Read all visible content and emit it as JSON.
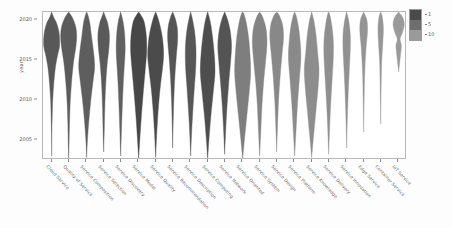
{
  "chart_data": {
    "type": "violin",
    "title": "",
    "xlabel": "",
    "ylabel": "year",
    "ylim": [
      2002.5,
      2021.0
    ],
    "yticks": [
      2005,
      2010,
      2015,
      2020
    ],
    "ytick_labels": [
      "2005",
      "2010",
      "2015",
      "2020"
    ],
    "grid": false,
    "legend": {
      "position": "top-right",
      "title": "",
      "entries": [
        {
          "label": "1",
          "color": "#4a4a4a"
        },
        {
          "label": "5",
          "color": "#6e6e6e"
        },
        {
          "label": "10",
          "color": "#9a9a9a"
        }
      ]
    },
    "categories": [
      "Cloud Service",
      "Quality of Service",
      "Service Composition",
      "Service Selection",
      "Service Discovery",
      "Service Model",
      "Service Quality",
      "Service Recommendation",
      "Service Description",
      "Service Computing",
      "Service Network",
      "Service Oriented",
      "Service System",
      "Service Design",
      "Service Platform",
      "Service Knowledge",
      "Service Delivery",
      "Service Innovation",
      "Edge Service",
      "Container Service",
      "IoT Service"
    ],
    "series": [
      {
        "name": "Cloud Service",
        "color": "#585858",
        "peak_year": 2017.2,
        "median": 2016.0,
        "widths": [
          {
            "year": 2003.0,
            "w": 0.0
          },
          {
            "year": 2005.5,
            "w": 0.02
          },
          {
            "year": 2008.0,
            "w": 0.07
          },
          {
            "year": 2010.0,
            "w": 0.13
          },
          {
            "year": 2012.0,
            "w": 0.26
          },
          {
            "year": 2014.0,
            "w": 0.46
          },
          {
            "year": 2015.5,
            "w": 0.72
          },
          {
            "year": 2016.8,
            "w": 1.0
          },
          {
            "year": 2018.4,
            "w": 0.93
          },
          {
            "year": 2019.6,
            "w": 0.62
          },
          {
            "year": 2020.4,
            "w": 0.22
          },
          {
            "year": 2021.0,
            "w": 0.0
          }
        ]
      },
      {
        "name": "Quality of Service",
        "color": "#5c5c5c",
        "peak_year": 2017.5,
        "median": 2015.5,
        "widths": [
          {
            "year": 2002.6,
            "w": 0.0
          },
          {
            "year": 2004.5,
            "w": 0.05
          },
          {
            "year": 2007.0,
            "w": 0.1
          },
          {
            "year": 2009.5,
            "w": 0.18
          },
          {
            "year": 2012.0,
            "w": 0.34
          },
          {
            "year": 2014.5,
            "w": 0.58
          },
          {
            "year": 2016.5,
            "w": 0.88
          },
          {
            "year": 2017.8,
            "w": 1.0
          },
          {
            "year": 2019.0,
            "w": 0.92
          },
          {
            "year": 2020.2,
            "w": 0.52
          },
          {
            "year": 2021.0,
            "w": 0.0
          }
        ]
      },
      {
        "name": "Service Composition",
        "color": "#5e5e5e",
        "peak_year": 2014.0,
        "median": 2013.0,
        "widths": [
          {
            "year": 2002.8,
            "w": 0.0
          },
          {
            "year": 2005.0,
            "w": 0.1
          },
          {
            "year": 2007.5,
            "w": 0.28
          },
          {
            "year": 2010.0,
            "w": 0.52
          },
          {
            "year": 2012.5,
            "w": 0.82
          },
          {
            "year": 2014.2,
            "w": 1.0
          },
          {
            "year": 2016.0,
            "w": 0.86
          },
          {
            "year": 2018.0,
            "w": 0.6
          },
          {
            "year": 2019.6,
            "w": 0.4
          },
          {
            "year": 2020.6,
            "w": 0.16
          },
          {
            "year": 2021.0,
            "w": 0.0
          }
        ]
      },
      {
        "name": "Service Selection",
        "color": "#5a5a5a",
        "peak_year": 2017.0,
        "median": 2015.0,
        "widths": [
          {
            "year": 2003.5,
            "w": 0.0
          },
          {
            "year": 2006.0,
            "w": 0.07
          },
          {
            "year": 2009.0,
            "w": 0.14
          },
          {
            "year": 2012.0,
            "w": 0.26
          },
          {
            "year": 2014.5,
            "w": 0.44
          },
          {
            "year": 2016.5,
            "w": 0.66
          },
          {
            "year": 2018.2,
            "w": 0.72
          },
          {
            "year": 2019.6,
            "w": 0.5
          },
          {
            "year": 2020.4,
            "w": 0.22
          },
          {
            "year": 2021.0,
            "w": 0.0
          }
        ]
      },
      {
        "name": "Service Discovery",
        "color": "#606060",
        "peak_year": 2016.0,
        "median": 2014.5,
        "widths": [
          {
            "year": 2003.0,
            "w": 0.0
          },
          {
            "year": 2005.5,
            "w": 0.08
          },
          {
            "year": 2008.5,
            "w": 0.18
          },
          {
            "year": 2011.5,
            "w": 0.3
          },
          {
            "year": 2014.0,
            "w": 0.44
          },
          {
            "year": 2016.2,
            "w": 0.56
          },
          {
            "year": 2018.2,
            "w": 0.5
          },
          {
            "year": 2019.8,
            "w": 0.3
          },
          {
            "year": 2020.6,
            "w": 0.1
          },
          {
            "year": 2021.0,
            "w": 0.0
          }
        ]
      },
      {
        "name": "Service Model",
        "color": "#474747",
        "peak_year": 2016.5,
        "median": 2014.0,
        "widths": [
          {
            "year": 2002.6,
            "w": 0.0
          },
          {
            "year": 2005.0,
            "w": 0.14
          },
          {
            "year": 2008.0,
            "w": 0.34
          },
          {
            "year": 2011.0,
            "w": 0.58
          },
          {
            "year": 2013.5,
            "w": 0.8
          },
          {
            "year": 2016.0,
            "w": 1.0
          },
          {
            "year": 2018.0,
            "w": 0.96
          },
          {
            "year": 2019.8,
            "w": 0.68
          },
          {
            "year": 2020.6,
            "w": 0.28
          },
          {
            "year": 2021.0,
            "w": 0.0
          }
        ]
      },
      {
        "name": "Service Quality",
        "color": "#4b4b4b",
        "peak_year": 2015.0,
        "median": 2014.0,
        "widths": [
          {
            "year": 2002.8,
            "w": 0.0
          },
          {
            "year": 2005.5,
            "w": 0.12
          },
          {
            "year": 2008.5,
            "w": 0.3
          },
          {
            "year": 2011.5,
            "w": 0.56
          },
          {
            "year": 2014.0,
            "w": 0.86
          },
          {
            "year": 2015.8,
            "w": 1.0
          },
          {
            "year": 2017.8,
            "w": 0.84
          },
          {
            "year": 2019.4,
            "w": 0.52
          },
          {
            "year": 2020.5,
            "w": 0.2
          },
          {
            "year": 2021.0,
            "w": 0.0
          }
        ]
      },
      {
        "name": "Service Recommendation",
        "color": "#555555",
        "peak_year": 2018.0,
        "median": 2016.5,
        "widths": [
          {
            "year": 2004.0,
            "w": 0.0
          },
          {
            "year": 2007.0,
            "w": 0.06
          },
          {
            "year": 2010.0,
            "w": 0.14
          },
          {
            "year": 2013.0,
            "w": 0.28
          },
          {
            "year": 2015.5,
            "w": 0.46
          },
          {
            "year": 2017.5,
            "w": 0.62
          },
          {
            "year": 2019.0,
            "w": 0.58
          },
          {
            "year": 2020.2,
            "w": 0.32
          },
          {
            "year": 2021.0,
            "w": 0.0
          }
        ]
      },
      {
        "name": "Service Description",
        "color": "#565656",
        "peak_year": 2014.5,
        "median": 2013.5,
        "widths": [
          {
            "year": 2003.0,
            "w": 0.0
          },
          {
            "year": 2005.5,
            "w": 0.1
          },
          {
            "year": 2008.5,
            "w": 0.26
          },
          {
            "year": 2011.5,
            "w": 0.46
          },
          {
            "year": 2014.2,
            "w": 0.64
          },
          {
            "year": 2016.5,
            "w": 0.66
          },
          {
            "year": 2018.5,
            "w": 0.5
          },
          {
            "year": 2020.0,
            "w": 0.24
          },
          {
            "year": 2021.0,
            "w": 0.0
          }
        ]
      },
      {
        "name": "Service Computing",
        "color": "#4e4e4e",
        "peak_year": 2013.5,
        "median": 2013.0,
        "widths": [
          {
            "year": 2002.6,
            "w": 0.0
          },
          {
            "year": 2005.0,
            "w": 0.16
          },
          {
            "year": 2008.0,
            "w": 0.4
          },
          {
            "year": 2011.0,
            "w": 0.7
          },
          {
            "year": 2013.5,
            "w": 0.92
          },
          {
            "year": 2015.8,
            "w": 0.82
          },
          {
            "year": 2017.8,
            "w": 0.62
          },
          {
            "year": 2019.6,
            "w": 0.36
          },
          {
            "year": 2020.6,
            "w": 0.12
          },
          {
            "year": 2021.0,
            "w": 0.0
          }
        ]
      },
      {
        "name": "Service Network",
        "color": "#545454",
        "peak_year": 2016.0,
        "median": 2014.5,
        "widths": [
          {
            "year": 2003.2,
            "w": 0.0
          },
          {
            "year": 2006.0,
            "w": 0.12
          },
          {
            "year": 2009.0,
            "w": 0.28
          },
          {
            "year": 2012.0,
            "w": 0.5
          },
          {
            "year": 2014.8,
            "w": 0.74
          },
          {
            "year": 2016.8,
            "w": 0.86
          },
          {
            "year": 2018.6,
            "w": 0.7
          },
          {
            "year": 2020.0,
            "w": 0.38
          },
          {
            "year": 2021.0,
            "w": 0.0
          }
        ]
      },
      {
        "name": "Service Oriented",
        "color": "#7e7e7e",
        "peak_year": 2013.0,
        "median": 2013.0,
        "widths": [
          {
            "year": 2002.6,
            "w": 0.0
          },
          {
            "year": 2005.0,
            "w": 0.22
          },
          {
            "year": 2008.0,
            "w": 0.52
          },
          {
            "year": 2011.0,
            "w": 0.82
          },
          {
            "year": 2013.5,
            "w": 1.0
          },
          {
            "year": 2016.0,
            "w": 0.9
          },
          {
            "year": 2018.0,
            "w": 0.72
          },
          {
            "year": 2019.8,
            "w": 0.42
          },
          {
            "year": 2020.8,
            "w": 0.14
          },
          {
            "year": 2021.0,
            "w": 0.0
          }
        ]
      },
      {
        "name": "Service System",
        "color": "#848484",
        "peak_year": 2016.8,
        "median": 2015.0,
        "widths": [
          {
            "year": 2003.0,
            "w": 0.0
          },
          {
            "year": 2006.0,
            "w": 0.14
          },
          {
            "year": 2009.5,
            "w": 0.3
          },
          {
            "year": 2012.5,
            "w": 0.52
          },
          {
            "year": 2015.0,
            "w": 0.76
          },
          {
            "year": 2017.2,
            "w": 0.92
          },
          {
            "year": 2019.0,
            "w": 0.78
          },
          {
            "year": 2020.4,
            "w": 0.36
          },
          {
            "year": 2021.0,
            "w": 0.0
          }
        ]
      },
      {
        "name": "Service Design",
        "color": "#888888",
        "peak_year": 2017.5,
        "median": 2016.0,
        "widths": [
          {
            "year": 2003.5,
            "w": 0.0
          },
          {
            "year": 2006.5,
            "w": 0.1
          },
          {
            "year": 2010.0,
            "w": 0.24
          },
          {
            "year": 2013.0,
            "w": 0.44
          },
          {
            "year": 2015.8,
            "w": 0.68
          },
          {
            "year": 2017.8,
            "w": 0.86
          },
          {
            "year": 2019.4,
            "w": 0.74
          },
          {
            "year": 2020.6,
            "w": 0.32
          },
          {
            "year": 2021.0,
            "w": 0.0
          }
        ]
      },
      {
        "name": "Service Platform",
        "color": "#8a8a8a",
        "peak_year": 2015.0,
        "median": 2014.0,
        "widths": [
          {
            "year": 2003.0,
            "w": 0.0
          },
          {
            "year": 2006.0,
            "w": 0.16
          },
          {
            "year": 2009.5,
            "w": 0.36
          },
          {
            "year": 2012.5,
            "w": 0.58
          },
          {
            "year": 2015.2,
            "w": 0.78
          },
          {
            "year": 2017.2,
            "w": 0.7
          },
          {
            "year": 2019.0,
            "w": 0.5
          },
          {
            "year": 2020.4,
            "w": 0.22
          },
          {
            "year": 2021.0,
            "w": 0.0
          }
        ]
      },
      {
        "name": "Service Knowledge",
        "color": "#8d8d8d",
        "peak_year": 2012.5,
        "median": 2013.0,
        "widths": [
          {
            "year": 2002.8,
            "w": 0.0
          },
          {
            "year": 2005.5,
            "w": 0.24
          },
          {
            "year": 2008.5,
            "w": 0.52
          },
          {
            "year": 2011.5,
            "w": 0.8
          },
          {
            "year": 2013.8,
            "w": 0.92
          },
          {
            "year": 2016.0,
            "w": 0.74
          },
          {
            "year": 2018.0,
            "w": 0.56
          },
          {
            "year": 2019.8,
            "w": 0.3
          },
          {
            "year": 2021.0,
            "w": 0.0
          }
        ]
      },
      {
        "name": "Service Delivery",
        "color": "#8f8f8f",
        "peak_year": 2016.0,
        "median": 2014.5,
        "widths": [
          {
            "year": 2003.2,
            "w": 0.0
          },
          {
            "year": 2006.5,
            "w": 0.12
          },
          {
            "year": 2010.0,
            "w": 0.28
          },
          {
            "year": 2013.0,
            "w": 0.46
          },
          {
            "year": 2015.8,
            "w": 0.6
          },
          {
            "year": 2017.8,
            "w": 0.56
          },
          {
            "year": 2019.4,
            "w": 0.38
          },
          {
            "year": 2020.6,
            "w": 0.16
          },
          {
            "year": 2021.0,
            "w": 0.0
          }
        ]
      },
      {
        "name": "Service Innovation",
        "color": "#919191",
        "peak_year": 2017.0,
        "median": 2015.5,
        "widths": [
          {
            "year": 2004.0,
            "w": 0.0
          },
          {
            "year": 2007.5,
            "w": 0.08
          },
          {
            "year": 2011.0,
            "w": 0.2
          },
          {
            "year": 2014.0,
            "w": 0.34
          },
          {
            "year": 2016.5,
            "w": 0.46
          },
          {
            "year": 2018.4,
            "w": 0.44
          },
          {
            "year": 2020.0,
            "w": 0.24
          },
          {
            "year": 2021.0,
            "w": 0.0
          }
        ]
      },
      {
        "name": "Edge Service",
        "color": "#949494",
        "peak_year": 2019.0,
        "median": 2018.0,
        "widths": [
          {
            "year": 2006.0,
            "w": 0.0
          },
          {
            "year": 2010.0,
            "w": 0.06
          },
          {
            "year": 2013.5,
            "w": 0.14
          },
          {
            "year": 2016.5,
            "w": 0.3
          },
          {
            "year": 2018.6,
            "w": 0.48
          },
          {
            "year": 2020.0,
            "w": 0.4
          },
          {
            "year": 2021.0,
            "w": 0.0
          }
        ]
      },
      {
        "name": "Container Service",
        "color": "#969696",
        "peak_year": 2018.5,
        "median": 2017.5,
        "widths": [
          {
            "year": 2007.0,
            "w": 0.0
          },
          {
            "year": 2011.0,
            "w": 0.05
          },
          {
            "year": 2014.5,
            "w": 0.12
          },
          {
            "year": 2017.0,
            "w": 0.26
          },
          {
            "year": 2019.0,
            "w": 0.34
          },
          {
            "year": 2020.4,
            "w": 0.2
          },
          {
            "year": 2021.0,
            "w": 0.0
          }
        ]
      },
      {
        "name": "IoT Service",
        "color": "#9a9a9a",
        "peak_year": 2019.5,
        "median": 2019.0,
        "widths": [
          {
            "year": 2013.5,
            "w": 0.0
          },
          {
            "year": 2015.5,
            "w": 0.22
          },
          {
            "year": 2016.8,
            "w": 0.34
          },
          {
            "year": 2017.6,
            "w": 0.18
          },
          {
            "year": 2018.4,
            "w": 0.46
          },
          {
            "year": 2019.4,
            "w": 0.7
          },
          {
            "year": 2020.3,
            "w": 0.52
          },
          {
            "year": 2021.0,
            "w": 0.0
          }
        ]
      }
    ]
  }
}
